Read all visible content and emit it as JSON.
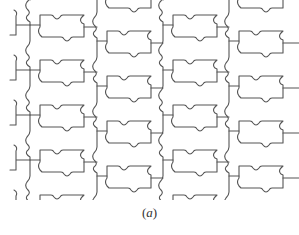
{
  "figure": {
    "stroke_color": "#555555",
    "stroke_width": 1.1,
    "columns": [
      {
        "boundary_x": 30,
        "tile_x": 38,
        "offset_y": 0
      },
      {
        "boundary_x": 97,
        "tile_x": 105,
        "offset_y": 16
      },
      {
        "boundary_x": 163,
        "tile_x": 171,
        "offset_y": 0
      },
      {
        "boundary_x": 229,
        "tile_x": 237,
        "offset_y": 16
      }
    ],
    "row_period": 45,
    "tile_width": 48,
    "tile_height": 22,
    "rows": 5
  },
  "caption": {
    "open": "(",
    "label": "a",
    "close": ")"
  }
}
